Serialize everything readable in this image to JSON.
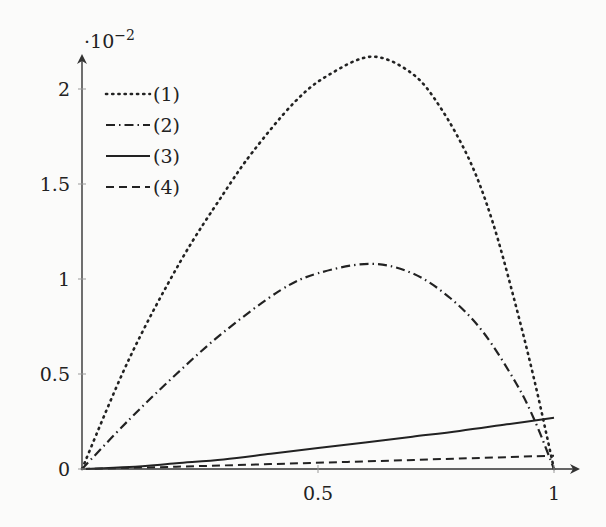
{
  "chart_data": {
    "type": "line",
    "title": "",
    "xlabel": "",
    "ylabel": "",
    "y_scale_label": "·10^-2",
    "y_scale_base": "·10",
    "y_scale_exp": "−2",
    "xlim": [
      0,
      1
    ],
    "ylim": [
      0,
      2.3
    ],
    "x_ticks": [
      0.5,
      1
    ],
    "x_tick_labels": [
      "0.5",
      "1"
    ],
    "y_ticks": [
      0,
      0.5,
      1,
      1.5,
      2
    ],
    "y_tick_labels": [
      "0",
      "0.5",
      "1",
      "1.5",
      "2"
    ],
    "grid": false,
    "legend_position": "upper left",
    "series": [
      {
        "name": "(1)",
        "style": "dotted",
        "x": [
          0,
          0.1,
          0.208,
          0.3,
          0.362,
          0.45,
          0.52,
          0.614,
          0.7,
          0.76,
          0.822,
          0.87,
          0.917,
          0.96,
          1.0
        ],
        "y": [
          0,
          0.58,
          1.09,
          1.45,
          1.67,
          1.93,
          2.07,
          2.17,
          2.08,
          1.9,
          1.62,
          1.3,
          0.88,
          0.45,
          0
        ]
      },
      {
        "name": "(2)",
        "style": "dashdot",
        "x": [
          0,
          0.1,
          0.2,
          0.3,
          0.42,
          0.5,
          0.61,
          0.7,
          0.78,
          0.85,
          0.92,
          0.96,
          1.0
        ],
        "y": [
          0,
          0.26,
          0.5,
          0.72,
          0.94,
          1.03,
          1.08,
          1.03,
          0.9,
          0.72,
          0.45,
          0.25,
          0
        ]
      },
      {
        "name": "(3)",
        "style": "solid",
        "x": [
          0,
          0.1,
          0.2,
          0.3,
          0.4,
          0.5,
          0.6,
          0.7,
          0.8,
          0.9,
          1.0
        ],
        "y": [
          0,
          0.01,
          0.03,
          0.05,
          0.08,
          0.11,
          0.14,
          0.17,
          0.2,
          0.235,
          0.27
        ]
      },
      {
        "name": "(4)",
        "style": "dashed",
        "x": [
          0,
          0.2,
          0.4,
          0.6,
          0.8,
          1.0
        ],
        "y": [
          0,
          0.012,
          0.026,
          0.04,
          0.055,
          0.07
        ]
      }
    ]
  }
}
